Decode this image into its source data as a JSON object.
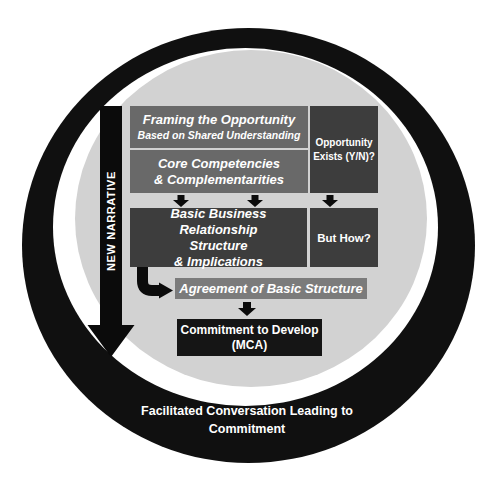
{
  "diagram": {
    "narrative_arrow": {
      "label": "NEW NARRATIVE"
    },
    "framing": {
      "title": "Framing the Opportunity",
      "subtitle": "Based on Shared Understanding"
    },
    "core": {
      "line1": "Core Competencies",
      "line2": "& Complementarities"
    },
    "opportunity": {
      "line1": "Opportunity",
      "line2": "Exists (Y/N)?"
    },
    "basic": {
      "line1": "Basic Business Relationship",
      "line2": "Structure",
      "line3": "& Implications"
    },
    "but_how": {
      "label": "But How?"
    },
    "agreement": {
      "label": "Agreement of Basic Structure"
    },
    "commitment": {
      "line1": "Commitment to Develop",
      "line2": "(MCA)"
    },
    "caption": {
      "line1": "Facilitated Conversation",
      "line2": "Leading to Commitment"
    },
    "icons": {
      "narrative_arrow": "big-down-arrow",
      "flow_arrow": "small-down-arrow",
      "elbow_arrow": "elbow-right-arrow"
    },
    "colors": {
      "ring": "#101010",
      "gap_ring": "#ffffff",
      "inner_circle": "#d2d2d2",
      "medium_box": "#696969",
      "dark_box": "#3d3d3d",
      "agreement_box": "#7b7b7b",
      "commitment_box": "#151515",
      "arrow": "#0b0b0b",
      "text": "#ffffff"
    }
  }
}
